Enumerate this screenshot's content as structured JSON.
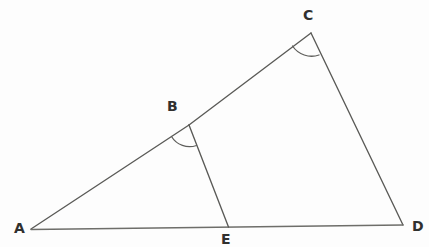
{
  "figure": {
    "type": "geometry-diagram",
    "width": 429,
    "height": 247,
    "background_color": "#fdfdfd",
    "line_color": "#555552",
    "baseline_color": "#6b6b68",
    "label_color": "#30302f",
    "points": [
      {
        "id": "A",
        "label": "A",
        "x": 31,
        "y": 229,
        "label_x": 14,
        "label_y": 221
      },
      {
        "id": "B",
        "label": "B",
        "x": 189,
        "y": 125,
        "label_x": 167,
        "label_y": 99
      },
      {
        "id": "C",
        "label": "C",
        "x": 311,
        "y": 33,
        "label_x": 303,
        "label_y": 8
      },
      {
        "id": "D",
        "label": "D",
        "x": 403,
        "y": 225,
        "label_x": 412,
        "label_y": 219
      },
      {
        "id": "E",
        "label": "E",
        "x": 228,
        "y": 227,
        "label_x": 221,
        "label_y": 232
      }
    ],
    "segments": [
      {
        "id": "AB",
        "from": "A",
        "to": "B",
        "style": "solid"
      },
      {
        "id": "BC",
        "from": "B",
        "to": "C",
        "style": "solid"
      },
      {
        "id": "CD",
        "from": "C",
        "to": "D",
        "style": "solid"
      },
      {
        "id": "AD",
        "from": "A",
        "to": "D",
        "style": "solid"
      },
      {
        "id": "BE",
        "from": "B",
        "to": "E",
        "style": "solid"
      }
    ],
    "angle_marks": [
      {
        "id": "angle-B",
        "at": "B",
        "between": [
          "A",
          "E"
        ],
        "marker": "arc"
      },
      {
        "id": "angle-C",
        "at": "C",
        "between": [
          "B",
          "D"
        ],
        "marker": "arc"
      }
    ],
    "scan_artifacts": [
      {
        "id": "artifact-left",
        "text": ",",
        "x": 56,
        "y": -6
      },
      {
        "id": "artifact-right",
        "text": "g",
        "x": 355,
        "y": -7
      }
    ]
  }
}
